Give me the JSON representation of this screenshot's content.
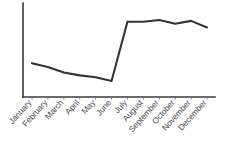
{
  "chart_data": {
    "type": "line",
    "title": "",
    "subtitle": "",
    "xlabel": "",
    "ylabel": "",
    "categories": [
      "January",
      "February",
      "March",
      "April",
      "May",
      "June",
      "July",
      "August",
      "September",
      "October",
      "November",
      "December"
    ],
    "values": [
      36,
      32,
      26,
      23,
      21,
      17,
      80,
      80,
      82,
      78,
      81,
      74
    ],
    "series": [
      {
        "name": "",
        "values": [
          36,
          32,
          26,
          23,
          21,
          17,
          80,
          80,
          82,
          78,
          81,
          74
        ],
        "color": "#333333"
      }
    ],
    "ylim": [
      0,
      100
    ],
    "xlim": [
      0,
      11
    ],
    "grid": false,
    "legend": false,
    "legend_position": "none",
    "y_tick_labels": [],
    "x_tick_labels": [
      "January",
      "February",
      "March",
      "April",
      "May",
      "June",
      "July",
      "August",
      "September",
      "October",
      "November",
      "December"
    ],
    "annotations": [],
    "axis_color": "#3a3a3a",
    "label_color": "#4a4a4a",
    "background_color": "#ffffff",
    "label_rotation_degrees": -48
  },
  "geometry": {
    "plot_left": 23,
    "plot_right": 215,
    "plot_top": 3,
    "plot_bottom": 97,
    "first_point_x": 32,
    "last_point_x": 207
  }
}
